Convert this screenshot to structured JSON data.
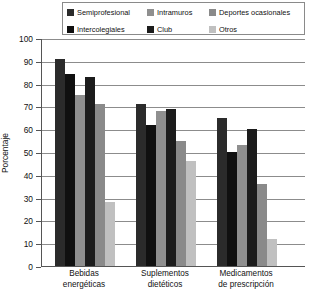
{
  "chart_data": {
    "type": "bar",
    "title": "",
    "xlabel": "",
    "ylabel": "Porcentaje",
    "ylim": [
      0,
      100
    ],
    "ytick_step": 10,
    "yticks": [
      100,
      90,
      80,
      70,
      60,
      50,
      40,
      30,
      20,
      10,
      0
    ],
    "grid": true,
    "legend_position": "top",
    "categories": [
      "Bebidas energéticas",
      "Suplementos dietéticos",
      "Medicamentos de prescripción"
    ],
    "category_lines": [
      [
        "Bebidas",
        "energéticas"
      ],
      [
        "Suplementos",
        "dietéticos"
      ],
      [
        "Medicamentos",
        "de prescripción"
      ]
    ],
    "series": [
      {
        "name": "Semiprofesional",
        "color": "#2b2b2b",
        "values": [
          91,
          71,
          65
        ]
      },
      {
        "name": "Intercolegiales",
        "color": "#101010",
        "values": [
          84,
          62,
          50
        ]
      },
      {
        "name": "Intramuros",
        "color": "#8f8f8f",
        "values": [
          75,
          68,
          53
        ]
      },
      {
        "name": "Club",
        "color": "#1c1c1c",
        "values": [
          83,
          69,
          60
        ]
      },
      {
        "name": "Deportes ocasionales",
        "color": "#8a8a8a",
        "values": [
          71,
          55,
          36
        ]
      },
      {
        "name": "Otros",
        "color": "#c0c0c0",
        "values": [
          28,
          46,
          12
        ]
      }
    ]
  },
  "legend": {
    "rows": [
      [
        {
          "label": "Semiprofesional",
          "color": "#2b2b2b"
        },
        {
          "label": "Intramuros",
          "color": "#8f8f8f"
        },
        {
          "label": "Deportes ocasionales",
          "color": "#8a8a8a"
        }
      ],
      [
        {
          "label": "Intercolegiales",
          "color": "#101010"
        },
        {
          "label": "Club",
          "color": "#1c1c1c"
        },
        {
          "label": "Otros",
          "color": "#c0c0c0"
        }
      ]
    ]
  },
  "axis": {
    "y_label": "Porcentaje",
    "y_ticks": [
      "100",
      "90",
      "80",
      "70",
      "60",
      "50",
      "40",
      "30",
      "20",
      "10",
      "0"
    ]
  }
}
